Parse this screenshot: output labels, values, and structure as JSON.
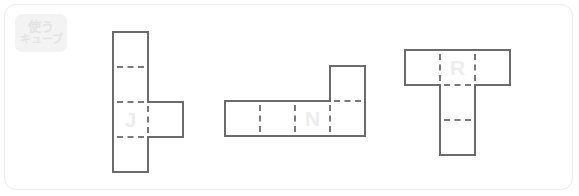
{
  "frame": {
    "background_color": "#ffffff",
    "border_color": "#eceded"
  },
  "badge": {
    "name": "use-cube-badge",
    "line1": "使う",
    "line2": "キューブ",
    "background_color": "#f3f3f3",
    "text_color": "#e3e3e3"
  },
  "style": {
    "outline_color": "#6b6b6b",
    "fold_line_color": "#7a7a7a",
    "label_color": "#ededed",
    "cell_size": 35
  },
  "nets": [
    {
      "id": "net-j",
      "label": "J",
      "label_cell": [
        0,
        2
      ],
      "origin": [
        108,
        27
      ],
      "cols": 2,
      "rows": 4,
      "cells": [
        [
          0,
          0
        ],
        [
          0,
          1
        ],
        [
          0,
          2
        ],
        [
          0,
          3
        ],
        [
          1,
          2
        ]
      ],
      "description": "vertical strip of four squares with one square attached to the right of the third square"
    },
    {
      "id": "net-n",
      "label": "N",
      "label_cell": [
        2,
        1
      ],
      "origin": [
        220,
        61
      ],
      "cols": 4,
      "rows": 2,
      "cells": [
        [
          0,
          1
        ],
        [
          1,
          1
        ],
        [
          2,
          1
        ],
        [
          3,
          1
        ],
        [
          3,
          0
        ]
      ],
      "description": "horizontal strip of four squares with one square attached above the fourth square"
    },
    {
      "id": "net-r",
      "label": "R",
      "label_cell": [
        1,
        0
      ],
      "origin": [
        400,
        45
      ],
      "cols": 3,
      "rows": 3,
      "cells": [
        [
          0,
          0
        ],
        [
          1,
          0
        ],
        [
          2,
          0
        ],
        [
          1,
          1
        ],
        [
          1,
          2
        ]
      ],
      "description": "T shape: three squares across the top with two squares hanging below the centre square"
    }
  ]
}
